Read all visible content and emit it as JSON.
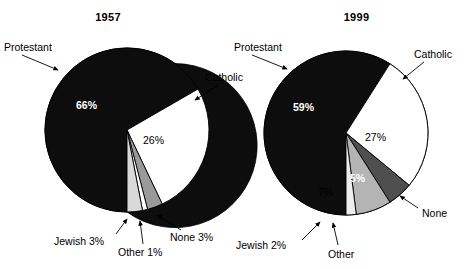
{
  "figure": {
    "caption": "",
    "background": "#ffffff"
  },
  "palette": {
    "protestant": "#0d0d0d",
    "catholic": "#ffffff",
    "none_1957": "#9a9a9a",
    "other_1957": "#ffffff",
    "jewish_1957": "#d9d9d9",
    "none_1999": "#4f4f4f",
    "other_1999": "#b4b4b4",
    "jewish_1999": "#ededed",
    "outline": "#000000",
    "text": "#000000",
    "text_on_dark": "#ffffff"
  },
  "charts": [
    {
      "id": "chart-1957",
      "title": "1957",
      "labels": {
        "protestant": "Protestant",
        "catholic": "Catholic",
        "jewish": "Jewish 3%",
        "other": "Other 1%",
        "none": "None 3%"
      },
      "percent_labels": {
        "protestant": "66%",
        "catholic": "26%"
      }
    },
    {
      "id": "chart-1999",
      "title": "1999",
      "labels": {
        "protestant": "Protestant",
        "catholic": "Catholic",
        "jewish": "Jewish 2%",
        "other": "Other",
        "none": "None"
      },
      "percent_labels": {
        "protestant": "59%",
        "catholic": "27%",
        "other": "7%",
        "none": "5%"
      }
    }
  ],
  "chart_data": [
    {
      "type": "pie",
      "title": "1957",
      "categories": [
        "Protestant",
        "Catholic",
        "None",
        "Other",
        "Jewish"
      ],
      "values": [
        66,
        26,
        3,
        1,
        3
      ],
      "value_labels": [
        "66%",
        "26%",
        "None 3%",
        "Other 1%",
        "Jewish 3%"
      ],
      "colors": [
        "#0d0d0d",
        "#ffffff",
        "#9a9a9a",
        "#ffffff",
        "#d9d9d9"
      ],
      "start_angle_deg": -54,
      "direction": "clockwise",
      "legend": "callout-labels",
      "grid": false
    },
    {
      "type": "pie",
      "title": "1999",
      "categories": [
        "Protestant",
        "Catholic",
        "None",
        "Other",
        "Jewish"
      ],
      "values": [
        59,
        27,
        5,
        7,
        2
      ],
      "value_labels": [
        "59%",
        "27%",
        "5%",
        "7%",
        "Jewish 2%"
      ],
      "colors": [
        "#0d0d0d",
        "#ffffff",
        "#4f4f4f",
        "#b4b4b4",
        "#ededed"
      ],
      "start_angle_deg": -42,
      "direction": "clockwise",
      "legend": "callout-labels",
      "grid": false
    }
  ]
}
